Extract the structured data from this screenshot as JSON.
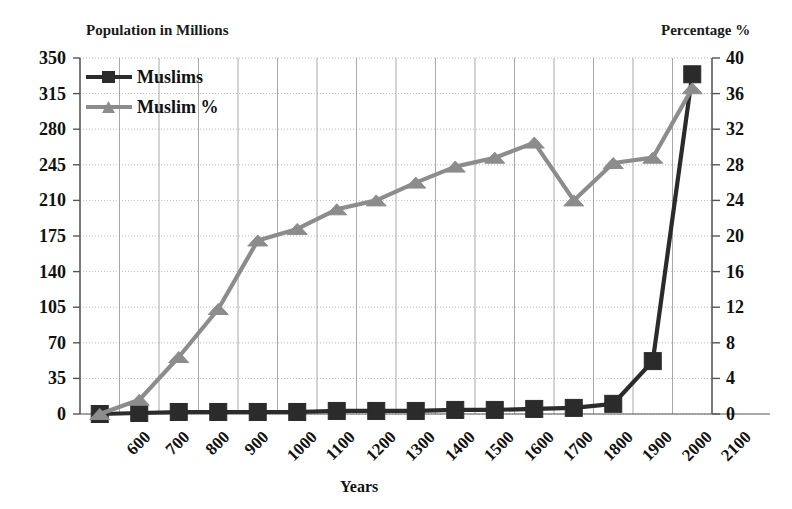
{
  "chart_data": {
    "type": "line",
    "title": "",
    "xlabel": "Years",
    "left_axis_label": "Population in Millions",
    "right_axis_label": "Percentage %",
    "grid": true,
    "legend_position": "top-left",
    "categories": [
      "600",
      "700",
      "800",
      "900",
      "1000",
      "1100",
      "1200",
      "1300",
      "1400",
      "1500",
      "1600",
      "1700",
      "1800",
      "1900",
      "2000",
      "2100"
    ],
    "left_ylim": [
      0,
      350
    ],
    "left_yticks": [
      "0",
      "35",
      "70",
      "105",
      "140",
      "175",
      "210",
      "245",
      "280",
      "315",
      "350"
    ],
    "right_ylim": [
      0,
      40
    ],
    "right_yticks": [
      "0",
      "4",
      "8",
      "12",
      "16",
      "20",
      "24",
      "28",
      "32",
      "36",
      "40"
    ],
    "series": [
      {
        "name": "Muslims",
        "axis": "left",
        "unit": "millions",
        "color": "#2b2b2b",
        "marker": "square",
        "values": [
          0,
          1,
          2,
          2,
          2,
          2,
          3,
          3,
          3,
          4,
          4,
          5,
          6,
          10,
          52,
          334
        ]
      },
      {
        "name": "Muslim %",
        "axis": "right",
        "unit": "percent",
        "color": "#8c8c8c",
        "marker": "triangle",
        "values": [
          0.0,
          1.6,
          6.4,
          11.8,
          19.5,
          20.8,
          23.0,
          24.0,
          26.0,
          27.8,
          28.8,
          30.5,
          24.0,
          28.2,
          28.8,
          36.6
        ]
      }
    ]
  },
  "legend": {
    "entries": [
      {
        "label": "Muslims",
        "icon": "square-marker-line"
      },
      {
        "label": "Muslim %",
        "icon": "triangle-marker-line"
      }
    ]
  },
  "colors": {
    "muslims_series": "#2b2b2b",
    "muslim_percent_series": "#8c8c8c",
    "grid": "#9a9a9a",
    "axis": "#555555",
    "text": "#111111"
  }
}
